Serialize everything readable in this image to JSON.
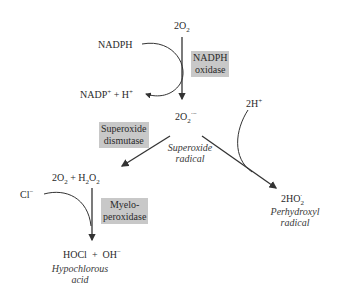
{
  "diagram": {
    "nodes": {
      "o2_top": {
        "main": "2O",
        "sub": "2"
      },
      "nadph": "NADPH",
      "nadp_h": {
        "a": "NADP",
        "a_sup": "+",
        "b": " + H",
        "b_sup": "+"
      },
      "superoxide": {
        "main": "2O",
        "sub": "2",
        "sup": "·−"
      },
      "superoxide_label": {
        "line1": "Superoxide",
        "line2": "radical"
      },
      "two_h": {
        "main": "2H",
        "sup": "+"
      },
      "o2_h2o2": {
        "a": "2O",
        "a_sub": "2",
        "b": " + H",
        "b_sub": "2",
        "c": "O",
        "c_sub": "2"
      },
      "chloride": {
        "main": "Cl",
        "sup": "−"
      },
      "hocl_oh": {
        "a": "HOCl  +  OH",
        "a_sup": "−"
      },
      "hocl_label": {
        "line1": "Hypochlorous",
        "line2": "acid"
      },
      "ho2": {
        "main": "2HO",
        "sub": "2",
        "sup": "·"
      },
      "ho2_label": {
        "line1": "Perhydroxyl",
        "line2": "radical"
      }
    },
    "enzymes": {
      "nadph_oxidase": {
        "line1": "NADPH",
        "line2": "oxidase"
      },
      "superoxide_dismutase": {
        "line1": "Superoxide",
        "line2": "dismutase"
      },
      "myeloperoxidase": {
        "line1": "Myelo-",
        "line2": "peroxidase"
      }
    },
    "colors": {
      "enzyme_box": "#c8c8c8",
      "line": "#333333",
      "text": "#2a2a2a"
    }
  }
}
